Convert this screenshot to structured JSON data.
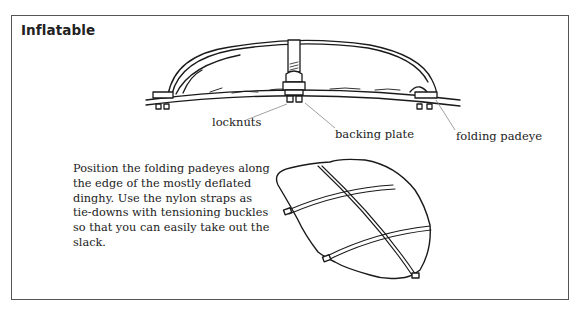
{
  "figure": {
    "title": "Inflatable",
    "labels": {
      "locknuts": "locknuts",
      "backing_plate": "backing plate",
      "folding_padeye": "folding padeye"
    },
    "caption": "Position the folding padeyes along the edge of the mostly deflated dinghy. Use the nylon straps as tie-downs with tensioning buckles so that you can easily take out the slack.",
    "illustrations": [
      "side-view-deflated-dinghy-on-curved-deck",
      "top-view-dinghy-strapped-with-padeyes"
    ],
    "colors": {
      "frame": "#555555",
      "ink": "#1a1a1a",
      "leader_line": "#888888"
    }
  }
}
